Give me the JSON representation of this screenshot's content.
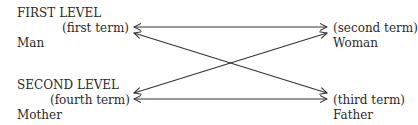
{
  "diagram": {
    "type": "semiotic-square-cross",
    "levels": [
      {
        "heading": "FIRST LEVEL",
        "left": {
          "term_label": "(first term)",
          "value": "Man"
        },
        "right": {
          "term_label": "(second term)",
          "value": "Woman"
        }
      },
      {
        "heading": "SECOND LEVEL",
        "left": {
          "term_label": "(fourth term)",
          "value": "Mother"
        },
        "right": {
          "term_label": "(third term)",
          "value": "Father"
        }
      }
    ],
    "connections": [
      {
        "from": "first term",
        "to": "second term",
        "style": "double-headed arrow"
      },
      {
        "from": "fourth term",
        "to": "third term",
        "style": "double-headed arrow"
      },
      {
        "from": "first term",
        "to": "third term",
        "style": "double-headed arrow"
      },
      {
        "from": "second term",
        "to": "fourth term",
        "style": "double-headed arrow"
      }
    ],
    "line_color": "#333333"
  }
}
